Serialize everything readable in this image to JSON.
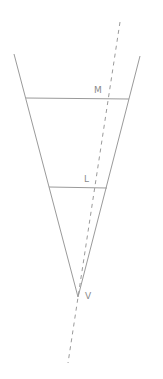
{
  "diagram": {
    "type": "geometry",
    "colors": {
      "stroke": "#9a9a9a",
      "dashed": "#9a9a9a",
      "label": "#8a8a8a",
      "background": "#ffffff"
    },
    "labels": {
      "M": "M",
      "L": "L",
      "V": "V"
    },
    "points": {
      "V": [
        78,
        297
      ],
      "left_top": [
        14,
        54
      ],
      "right_top": [
        140,
        56
      ],
      "M_line_left": [
        26,
        98
      ],
      "M_line_right": [
        129,
        98
      ],
      "L_line_left": [
        49,
        187
      ],
      "L_line_right": [
        107,
        187
      ],
      "dashed_start": [
        120,
        22
      ],
      "dashed_end": [
        68,
        363
      ]
    }
  }
}
